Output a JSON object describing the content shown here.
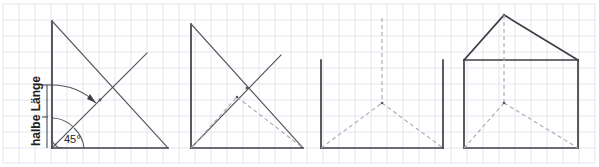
{
  "figure": {
    "background_color": "#ffffff",
    "grid": {
      "minor_color": "#e2e6ec",
      "major_color": "#d3d8e0",
      "cell_size_px": 16,
      "origin_x": 3,
      "origin_y": 4
    },
    "stroke_colors": {
      "solid": "#54575c",
      "heavy": "#3c3f44",
      "dashed": "#a8acb3",
      "dimension": "#4a4d52",
      "text": "#25282c"
    },
    "baseline_y": 148
  },
  "labels": {
    "angle": "45°",
    "dimension": "halbe Länge"
  },
  "panels": [
    {
      "index": 1,
      "name": "panel-angle-construction",
      "caption": "halbe Länge / 45°",
      "apex": {
        "x": 52,
        "y": 21
      },
      "base_left": {
        "x": 52,
        "y": 148
      },
      "base_right": {
        "x": 168,
        "y": 148
      },
      "diagonal_end": {
        "x": 147,
        "y": 53
      },
      "angle_value": "45°",
      "dimension_label": "halbe Länge",
      "dimension_top_y": 85,
      "dimension_bottom_y": 148
    },
    {
      "index": 2,
      "name": "panel-triangle-cross",
      "apex": {
        "x": 191,
        "y": 24
      },
      "base_left": {
        "x": 191,
        "y": 148
      },
      "base_right": {
        "x": 303,
        "y": 148
      },
      "diagonal_end": {
        "x": 281,
        "y": 55
      },
      "crossing_point": {
        "x": 247,
        "y": 88
      }
    },
    {
      "index": 3,
      "name": "panel-walls-dashed-roof",
      "wall_left_x": 321,
      "wall_right_x": 443,
      "wall_top_y": 60,
      "base_y": 148,
      "peak": {
        "x": 382,
        "y": 103
      },
      "vertical_dashed_top_y": 18
    },
    {
      "index": 4,
      "name": "panel-house-complete",
      "body_left_x": 464,
      "body_right_x": 578,
      "body_top_y": 60,
      "base_y": 148,
      "roof_apex": {
        "x": 504,
        "y": 15
      },
      "node": {
        "x": 521,
        "y": 103
      },
      "vertical_dashed_top_y": 15
    }
  ]
}
